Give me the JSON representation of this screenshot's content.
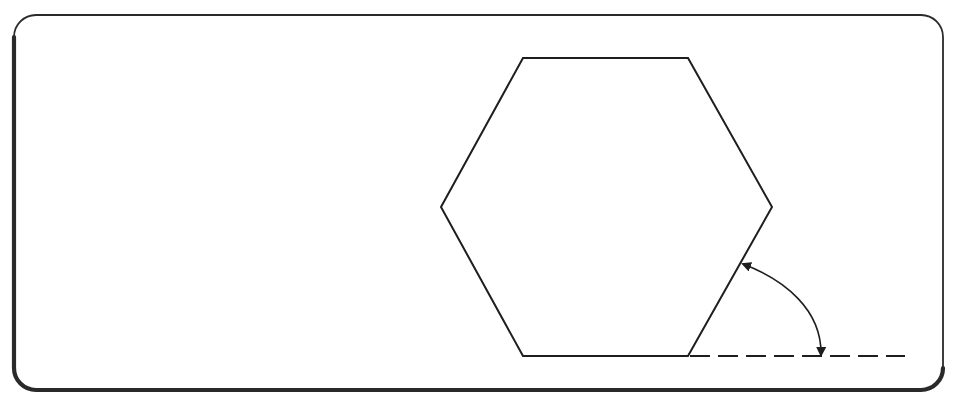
{
  "canvas": {
    "width": 955,
    "height": 398,
    "background": "#ffffff"
  },
  "frame": {
    "x": 14,
    "y": 15,
    "width": 929,
    "height": 375,
    "radius": 22,
    "stroke": "#2a2a2a",
    "thin_width": 1.8,
    "thick_width": 4.2
  },
  "hexagon": {
    "points": [
      [
        523,
        58
      ],
      [
        688,
        58
      ],
      [
        772,
        207
      ],
      [
        688,
        356
      ],
      [
        523,
        356
      ],
      [
        441,
        207
      ]
    ],
    "stroke": "#1e1e1e",
    "stroke_width": 2
  },
  "extension_line": {
    "x1": 690,
    "y1": 356,
    "x2": 905,
    "y2": 356,
    "stroke": "#1e1e1e",
    "stroke_width": 2,
    "dash": "20 8",
    "style": "dashed"
  },
  "angle_arc": {
    "start": [
      743,
      264
    ],
    "end": [
      821,
      355
    ],
    "control1": [
      785,
      280
    ],
    "control2": [
      822,
      310
    ],
    "stroke": "#1e1e1e",
    "stroke_width": 1.6,
    "arrowheads": "both",
    "meaning": "angle between hexagon edge and horizontal extension"
  }
}
